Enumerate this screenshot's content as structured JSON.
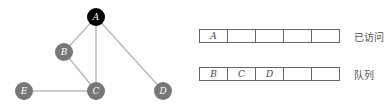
{
  "graph": {
    "nodes": [
      {
        "id": "A",
        "label": "A",
        "x": 96,
        "y": 17,
        "color": "#000000"
      },
      {
        "id": "B",
        "label": "B",
        "x": 64,
        "y": 52,
        "color": "#777777"
      },
      {
        "id": "C",
        "label": "C",
        "x": 96,
        "y": 91,
        "color": "#777777"
      },
      {
        "id": "D",
        "label": "D",
        "x": 163,
        "y": 91,
        "color": "#777777"
      },
      {
        "id": "E",
        "label": "E",
        "x": 24,
        "y": 91,
        "color": "#777777"
      }
    ],
    "edges": [
      [
        "A",
        "B"
      ],
      [
        "A",
        "C"
      ],
      [
        "A",
        "D"
      ],
      [
        "B",
        "C"
      ],
      [
        "E",
        "C"
      ]
    ],
    "edge_color": "#bbbbbb"
  },
  "visited": {
    "label": "已访问",
    "cells": [
      "A",
      "",
      "",
      "",
      ""
    ]
  },
  "queue": {
    "label": "队列",
    "cells": [
      "B",
      "C",
      "D",
      "",
      ""
    ]
  }
}
